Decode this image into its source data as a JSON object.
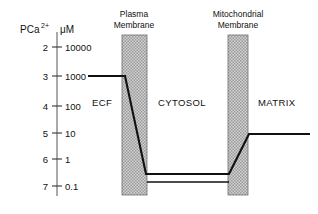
{
  "figure": {
    "axis": {
      "header_left": "PCa",
      "header_left_sup": "2+",
      "header_right": "μM",
      "ticks": [
        {
          "pca": "2",
          "conc": "10000",
          "y": 47
        },
        {
          "pca": "3",
          "conc": "1000",
          "y": 76
        },
        {
          "pca": "4",
          "conc": "100",
          "y": 106
        },
        {
          "pca": "5",
          "conc": "10",
          "y": 133
        },
        {
          "pca": "6",
          "conc": "1",
          "y": 159
        },
        {
          "pca": "7",
          "conc": "0.1",
          "y": 186
        }
      ],
      "line_x": 57,
      "line_y_top": 32,
      "line_y_bottom": 196
    },
    "membranes": [
      {
        "name": "plasma-membrane",
        "label_line1": "Plasma",
        "label_line2": "Membrane",
        "label_cx": 134,
        "x": 122,
        "width": 25,
        "y": 35,
        "height": 160
      },
      {
        "name": "mitochondrial-membrane",
        "label_line1": "Mitochondrial",
        "label_line2": "Membrane",
        "label_cx": 238,
        "x": 228,
        "width": 20,
        "y": 35,
        "height": 160
      }
    ],
    "compartments": [
      {
        "name": "ecf",
        "label": "ECF",
        "x": 92,
        "y": 106
      },
      {
        "name": "cytosol",
        "label": "CYTOSOL",
        "x": 158,
        "y": 106
      },
      {
        "name": "matrix",
        "label": "MATRIX",
        "x": 258,
        "y": 106
      }
    ],
    "frame": {
      "bottom_y": 182,
      "bottom_x1": 147,
      "bottom_x2": 229
    },
    "colors": {
      "ink": "#111111",
      "membrane_fill": "#c9c9c9",
      "membrane_edge": "#7a7a7a",
      "background": "#ffffff"
    }
  },
  "chart_data": {
    "type": "line",
    "title": "",
    "xlabel": "",
    "ylabel": "PCa2+ / μM",
    "y_axis": {
      "pca_ticks": [
        2,
        3,
        4,
        5,
        6,
        7
      ],
      "concentration_ticks_uM": [
        10000,
        1000,
        100,
        10,
        1,
        0.1
      ],
      "inverted": true
    },
    "regions": [
      {
        "name": "ECF",
        "pca": 3,
        "concentration_uM": 1000
      },
      {
        "name": "CYTOSOL",
        "pca": 6.8,
        "concentration_uM": 0.15
      },
      {
        "name": "MATRIX",
        "pca": 5,
        "concentration_uM": 10
      }
    ],
    "series": [
      {
        "name": "Ca2+ concentration profile",
        "points": [
          {
            "x": 88,
            "y": 76,
            "pca": 3
          },
          {
            "x": 125,
            "y": 76,
            "pca": 3
          },
          {
            "x": 146,
            "y": 174,
            "pca": 6.8
          },
          {
            "x": 229,
            "y": 174,
            "pca": 6.8
          },
          {
            "x": 249,
            "y": 134,
            "pca": 5
          },
          {
            "x": 310,
            "y": 134,
            "pca": 5
          }
        ]
      }
    ],
    "legend": null,
    "grid": false
  }
}
